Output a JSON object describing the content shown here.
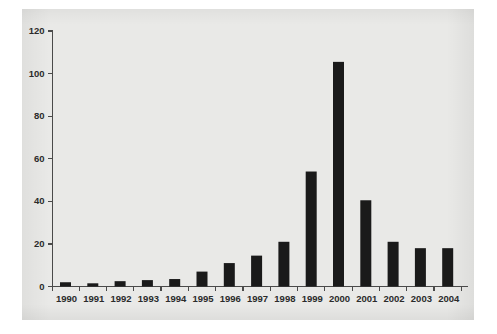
{
  "figure": {
    "panel_background": "#e9e9e7",
    "outer_background": "#ffffff",
    "bar_color": "#1a1a1a",
    "axis_color": "#4a4a4a"
  },
  "chart_data": {
    "type": "bar",
    "title": "",
    "subtitle": "",
    "xlabel": "",
    "ylabel": "",
    "categories": [
      "1990",
      "1991",
      "1992",
      "1993",
      "1994",
      "1995",
      "1996",
      "1997",
      "1998",
      "1999",
      "2000",
      "2001",
      "2002",
      "2003",
      "2004"
    ],
    "values": [
      2,
      1.5,
      2.5,
      3,
      3.5,
      7,
      11,
      14.5,
      21,
      54,
      105.5,
      40.5,
      21,
      18,
      18
    ],
    "series": [
      {
        "name": "",
        "values": [
          2,
          1.5,
          2.5,
          3,
          3.5,
          7,
          11,
          14.5,
          21,
          54,
          105.5,
          40.5,
          21,
          18,
          18
        ]
      }
    ],
    "ylim": [
      0,
      120
    ],
    "yticks": [
      0,
      20,
      40,
      60,
      80,
      100,
      120
    ],
    "ytick_labels": [
      "0",
      "20",
      "40",
      "60",
      "80",
      "100",
      "120"
    ],
    "xtick_labels": [
      "1990",
      "1991",
      "1992",
      "1993",
      "1994",
      "1995",
      "1996",
      "1997",
      "1998",
      "1999",
      "2000",
      "2001",
      "2002",
      "2003",
      "2004"
    ],
    "grid": false,
    "legend": null,
    "legend_position": "none",
    "annotations": []
  }
}
